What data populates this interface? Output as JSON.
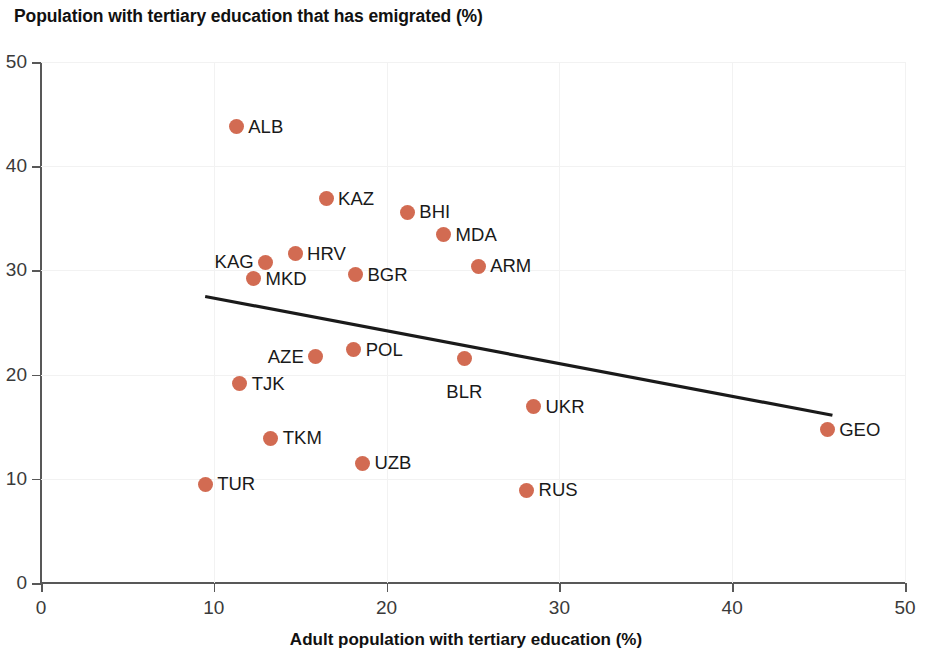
{
  "chart_data": {
    "type": "scatter",
    "title": "Population with tertiary education that has emigrated (%)",
    "subtitle": "",
    "xlabel": "Adult population with tertiary education (%)",
    "ylabel": "",
    "xlim": [
      0,
      50
    ],
    "ylim": [
      0,
      50
    ],
    "xticks": [
      0,
      10,
      20,
      30,
      40,
      50
    ],
    "yticks": [
      0,
      10,
      20,
      30,
      40,
      50
    ],
    "xtick_labels": [
      "0",
      "10",
      "20",
      "30",
      "40",
      "50"
    ],
    "ytick_labels": [
      "0",
      "10",
      "20",
      "30",
      "40",
      "50"
    ],
    "grid": true,
    "legend": false,
    "marker_color": "#d26b52",
    "trendline_color": "#1a1a1a",
    "points": [
      {
        "label": "ALB",
        "x": 11.3,
        "y": 43.8,
        "label_side": "right"
      },
      {
        "label": "KAZ",
        "x": 16.5,
        "y": 36.9,
        "label_side": "right"
      },
      {
        "label": "BHI",
        "x": 21.2,
        "y": 35.6,
        "label_side": "right"
      },
      {
        "label": "MDA",
        "x": 23.3,
        "y": 33.4,
        "label_side": "right"
      },
      {
        "label": "HRV",
        "x": 14.7,
        "y": 31.6,
        "label_side": "right"
      },
      {
        "label": "KAG",
        "x": 13.0,
        "y": 30.8,
        "label_side": "left"
      },
      {
        "label": "ARM",
        "x": 25.3,
        "y": 30.4,
        "label_side": "right"
      },
      {
        "label": "BGR",
        "x": 18.2,
        "y": 29.6,
        "label_side": "right"
      },
      {
        "label": "MKD",
        "x": 12.3,
        "y": 29.2,
        "label_side": "right"
      },
      {
        "label": "POL",
        "x": 18.1,
        "y": 22.4,
        "label_side": "right"
      },
      {
        "label": "AZE",
        "x": 15.9,
        "y": 21.7,
        "label_side": "left"
      },
      {
        "label": "BLR",
        "x": 24.5,
        "y": 21.5,
        "label_side": "below"
      },
      {
        "label": "TJK",
        "x": 11.5,
        "y": 19.1,
        "label_side": "right"
      },
      {
        "label": "UKR",
        "x": 28.5,
        "y": 16.9,
        "label_side": "right"
      },
      {
        "label": "GEO",
        "x": 45.5,
        "y": 14.7,
        "label_side": "right"
      },
      {
        "label": "TKM",
        "x": 13.3,
        "y": 13.9,
        "label_side": "right"
      },
      {
        "label": "UZB",
        "x": 18.6,
        "y": 11.5,
        "label_side": "right"
      },
      {
        "label": "TUR",
        "x": 9.5,
        "y": 9.5,
        "label_side": "right"
      },
      {
        "label": "RUS",
        "x": 28.1,
        "y": 8.9,
        "label_side": "right"
      }
    ],
    "trendline": {
      "x0": 9.5,
      "y0": 27.5,
      "x1": 45.8,
      "y1": 16.1
    }
  }
}
